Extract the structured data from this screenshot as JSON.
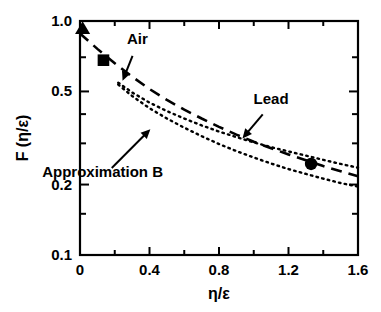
{
  "chart_data": {
    "type": "line",
    "title": "",
    "subtitle": "",
    "xlabel": "η/ε",
    "ylabel": "F (η/ε)",
    "xscale": "linear",
    "yscale": "log",
    "xlim": [
      0,
      1.6
    ],
    "ylim": [
      0.1,
      1.0
    ],
    "grid": false,
    "legend_position": "inline-annotations",
    "x_ticks": [
      "0",
      "0.4",
      "0.8",
      "1.2",
      "1.6"
    ],
    "x_tick_values": [
      0,
      0.4,
      0.8,
      1.2,
      1.6
    ],
    "x_minor_tick_values": [
      0.2,
      0.6,
      1.0,
      1.4
    ],
    "y_ticks": [
      "1.0",
      "0.5",
      "0.2",
      "0.1"
    ],
    "y_tick_values": [
      1.0,
      0.5,
      0.2,
      0.1
    ],
    "y_minor_tick_values": [
      0.7,
      0.4,
      0.3,
      0.15
    ],
    "series": [
      {
        "name": "Lead",
        "style": "dotted",
        "x": [
          0.22,
          0.3,
          0.4,
          0.5,
          0.6,
          0.7,
          0.8,
          0.9,
          1.0,
          1.1,
          1.2,
          1.3,
          1.4,
          1.5,
          1.6
        ],
        "values": [
          0.545,
          0.495,
          0.448,
          0.412,
          0.383,
          0.358,
          0.337,
          0.319,
          0.303,
          0.289,
          0.277,
          0.266,
          0.255,
          0.245,
          0.236
        ]
      },
      {
        "name": "Air",
        "style": "dotted",
        "x": [
          0.22,
          0.3,
          0.4,
          0.5,
          0.6,
          0.7,
          0.8,
          0.9,
          1.0,
          1.1,
          1.2,
          1.3,
          1.4,
          1.5,
          1.6
        ],
        "values": [
          0.535,
          0.478,
          0.424,
          0.383,
          0.35,
          0.322,
          0.298,
          0.278,
          0.261,
          0.246,
          0.233,
          0.222,
          0.212,
          0.203,
          0.196
        ]
      },
      {
        "name": "Approximation B",
        "style": "dashed",
        "x": [
          0.0,
          0.05,
          0.1,
          0.15,
          0.2,
          0.3,
          0.4,
          0.5,
          0.6,
          0.7,
          0.8,
          0.9,
          1.0,
          1.1,
          1.2,
          1.3,
          1.4,
          1.5,
          1.6
        ],
        "values": [
          0.885,
          0.82,
          0.76,
          0.707,
          0.66,
          0.578,
          0.512,
          0.46,
          0.418,
          0.383,
          0.353,
          0.327,
          0.305,
          0.286,
          0.269,
          0.254,
          0.24,
          0.228,
          0.217
        ]
      }
    ],
    "points": [
      {
        "marker": "triangle",
        "x": 0.015,
        "y": 0.93
      },
      {
        "marker": "square",
        "x": 0.135,
        "y": 0.68
      },
      {
        "marker": "circle",
        "x": 1.33,
        "y": 0.245
      }
    ],
    "annotations": [
      {
        "text": "Air",
        "text_x": 0.33,
        "text_y": 0.8,
        "arrow_to_x": 0.245,
        "arrow_to_y": 0.555
      },
      {
        "text": "Lead",
        "text_x": 1.1,
        "text_y": 0.44,
        "arrow_to_x": 0.935,
        "arrow_to_y": 0.315
      },
      {
        "text": "Approximation B",
        "text_x": 0.13,
        "text_y": 0.215,
        "arrow_to_x": 0.405,
        "arrow_to_y": 0.345
      }
    ],
    "colors": {
      "axis": "#000000",
      "curve": "#000000",
      "marker": "#000000",
      "background": "#ffffff"
    }
  }
}
